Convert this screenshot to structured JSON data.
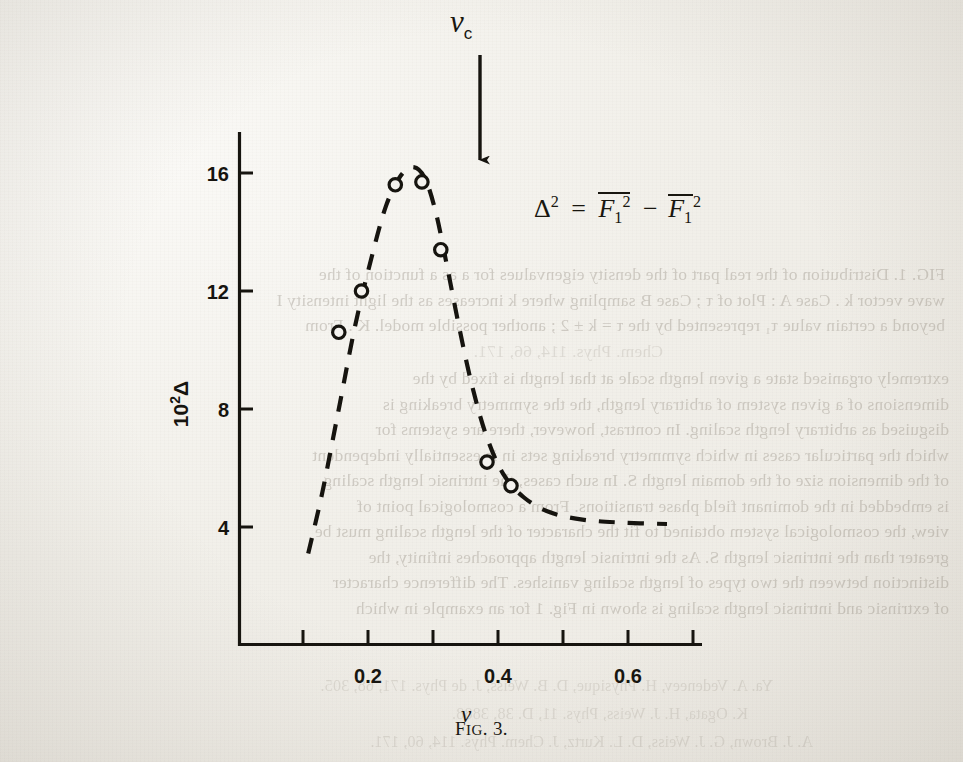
{
  "page": {
    "caption": "FIG. 3.",
    "caption_prefix": "F",
    "caption_smallcaps": "IG",
    "caption_suffix": ". 3."
  },
  "figure": {
    "arrow_label_main": "ν",
    "arrow_label_sub": "c",
    "annotation": {
      "delta": "Δ",
      "delta_exp": "2",
      "equals": "=",
      "f1_a": "F",
      "f1_a_sub": "1",
      "f1_a_exp": "2",
      "minus": "−",
      "f1_b": "F",
      "f1_b_sub": "1",
      "f1_b_exp": "2"
    }
  },
  "chart_data": {
    "type": "scatter",
    "title": "FIG. 3.",
    "xlabel": "ν",
    "ylabel": "10²Δ",
    "xlim": [
      0.0,
      0.72
    ],
    "ylim": [
      2.6,
      17.6
    ],
    "xticks": [
      0.1,
      0.2,
      0.3,
      0.4,
      0.5,
      0.6,
      0.7
    ],
    "xtick_labels": [
      "",
      "0.2",
      "",
      "0.4",
      "",
      "0.6",
      ""
    ],
    "yticks": [
      4,
      8,
      12,
      16
    ],
    "ytick_labels": [
      "4",
      "8",
      "12",
      "16"
    ],
    "grid": false,
    "legend": null,
    "marker": "open-circle",
    "line_style": "dashed",
    "points": [
      {
        "x": 0.155,
        "y": 10.6
      },
      {
        "x": 0.19,
        "y": 12.0
      },
      {
        "x": 0.242,
        "y": 15.6
      },
      {
        "x": 0.283,
        "y": 15.7
      },
      {
        "x": 0.312,
        "y": 13.4
      },
      {
        "x": 0.383,
        "y": 6.2
      },
      {
        "x": 0.42,
        "y": 5.4
      }
    ],
    "curve": [
      {
        "x": 0.108,
        "y": 3.1
      },
      {
        "x": 0.13,
        "y": 5.2
      },
      {
        "x": 0.155,
        "y": 8.0
      },
      {
        "x": 0.18,
        "y": 10.8
      },
      {
        "x": 0.205,
        "y": 13.1
      },
      {
        "x": 0.228,
        "y": 14.9
      },
      {
        "x": 0.25,
        "y": 15.9
      },
      {
        "x": 0.27,
        "y": 16.2
      },
      {
        "x": 0.288,
        "y": 15.8
      },
      {
        "x": 0.305,
        "y": 14.6
      },
      {
        "x": 0.322,
        "y": 12.8
      },
      {
        "x": 0.34,
        "y": 10.8
      },
      {
        "x": 0.36,
        "y": 8.8
      },
      {
        "x": 0.382,
        "y": 7.1
      },
      {
        "x": 0.408,
        "y": 5.8
      },
      {
        "x": 0.44,
        "y": 5.0
      },
      {
        "x": 0.48,
        "y": 4.5
      },
      {
        "x": 0.53,
        "y": 4.25
      },
      {
        "x": 0.59,
        "y": 4.15
      },
      {
        "x": 0.66,
        "y": 4.1
      }
    ],
    "annotations": [
      {
        "text": "νc",
        "type": "arrow-marker",
        "x": 0.288,
        "note": "downward arrow marking critical frequency"
      },
      {
        "text": "Δ² = F̅₁² − F̅₁²",
        "type": "formula",
        "x": 0.46,
        "y": 14.0
      }
    ]
  },
  "bleed_text": {
    "block_caption": [
      "FIG. 1.  Distribution of the real part of the density eigenvalues for a as a function of the",
      "wave vector  k .  Case  A :  Plot of  τ ;  Case  B  sampling where  k  increases as the light intensity  I",
      "beyond a certain value  τ₁  represented by the  τ = k ± 2 ;  another possible model.  K .  From",
      "Chem. Phys. 114, 66, 171."
    ],
    "block_body": [
      "extremely organised state a given length scale at that length is fixed by the",
      "dimensions of a given system of arbitrary length, the the symmetry breaking is",
      "disguised as arbitrary length scaling.   In contrast, however, there are systems for",
      "which the particular cases in which symmetry breaking sets in is essentially independent",
      "of the dimension size of the domain length S.   In such cases, the intrinsic length scaling",
      "is embedded in the dominant field phase transitions.   From a cosmological point of",
      "view, the cosmological system obtained to fit the character of the length scaling must be",
      "greater than the intrinsic length S.   As the intrinsic length approaches infinity, the",
      "distinction between the two types of length scaling vanishes.   The difference character",
      "of extrinsic and intrinsic length scaling is shown in Fig. 1 for an example in which"
    ],
    "block_refs": [
      "Ya. A. Vedeneev, H. Physique, D. B. Weiss, J. de Phys. 171, 68, 305.",
      "K. Ogata, H. J. Weiss, Phys. 11, D. 38, 3888.",
      "A. J. Brown, G. J. Weiss, D. L. Kurtz, J. Chem. Phys. 114, 60, 171."
    ]
  }
}
